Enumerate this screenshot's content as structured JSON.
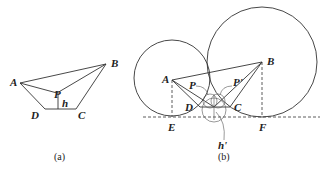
{
  "figure": {
    "panel_a": {
      "caption": "(a)",
      "labels": {
        "A": "A",
        "B": "B",
        "P": "P",
        "h": "h",
        "D": "D",
        "C": "C"
      }
    },
    "panel_b": {
      "caption": "(b)",
      "labels": {
        "A": "A",
        "B": "B",
        "P": "P",
        "P_prime": "P'",
        "D": "D",
        "C": "C",
        "E": "E",
        "F": "F",
        "h_prime": "h'"
      }
    }
  },
  "colors": {
    "line": "#333333",
    "background": "#ffffff"
  }
}
